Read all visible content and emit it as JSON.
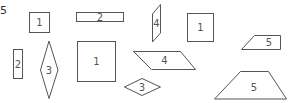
{
  "question_number": "5",
  "shapes": [
    {
      "kind": "square",
      "label": "1"
    },
    {
      "kind": "rectangle",
      "label": "2"
    },
    {
      "kind": "parallelogram",
      "label": "4"
    },
    {
      "kind": "square",
      "label": "1"
    },
    {
      "kind": "trapezoid",
      "label": "5"
    },
    {
      "kind": "rectangle",
      "label": "2"
    },
    {
      "kind": "rhombus",
      "label": "3"
    },
    {
      "kind": "square",
      "label": "1"
    },
    {
      "kind": "parallelogram",
      "label": "4"
    },
    {
      "kind": "rhombus",
      "label": "3"
    },
    {
      "kind": "trapezoid",
      "label": "5"
    }
  ]
}
